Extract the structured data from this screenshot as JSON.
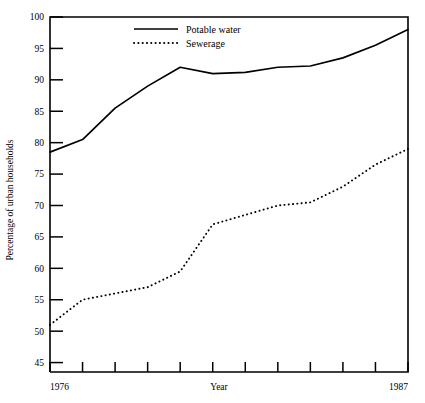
{
  "chart_data": {
    "type": "line",
    "title": "",
    "xlabel": "Year",
    "ylabel": "Percentage of urban households",
    "x": [
      1976,
      1977,
      1978,
      1979,
      1980,
      1981,
      1982,
      1983,
      1984,
      1985,
      1986,
      1987
    ],
    "xlim": [
      1976,
      1987
    ],
    "ylim": [
      43.5,
      100
    ],
    "grid": false,
    "legend_position": "top-center",
    "y_ticks": [
      45,
      50,
      55,
      60,
      65,
      70,
      75,
      80,
      85,
      90,
      95,
      100
    ],
    "y_tick_labels": [
      "45",
      "50",
      "55",
      "60",
      "65",
      "70",
      "75",
      "80",
      "85",
      "90",
      "95",
      "100"
    ],
    "x_tick_labels_shown": [
      "1976",
      "1987"
    ],
    "x_tick_count": 12,
    "series": [
      {
        "name": "Potable water",
        "style": "solid",
        "color": "#000000",
        "values": [
          78.5,
          80.5,
          85.5,
          89.0,
          92.0,
          91.0,
          91.2,
          92.0,
          92.2,
          93.5,
          95.5,
          98.0
        ]
      },
      {
        "name": "Sewerage",
        "style": "dotted",
        "color": "#000000",
        "values": [
          51.0,
          55.0,
          56.0,
          57.0,
          59.5,
          67.0,
          68.5,
          70.0,
          70.5,
          73.0,
          76.5,
          79.0
        ]
      }
    ]
  },
  "legend": {
    "entries": [
      {
        "label": "Potable water"
      },
      {
        "label": "Sewerage"
      }
    ]
  },
  "axes": {
    "x_start_label": "1976",
    "x_end_label": "1987",
    "x_axis_title": "Year",
    "y_axis_title": "Percentage of urban households"
  },
  "colors": {
    "background": "#ffffff",
    "foreground": "#000000"
  }
}
